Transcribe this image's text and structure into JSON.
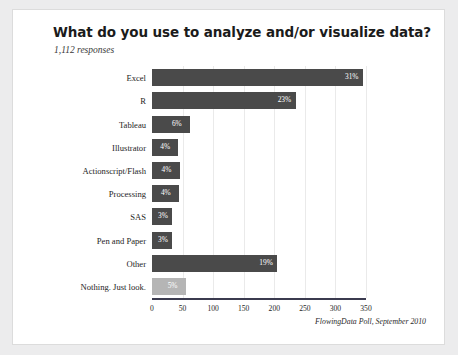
{
  "card": {
    "title": "What do you use to analyze and/or visualize data?",
    "subtitle": "1,112 responses",
    "credit": "FlowingData Poll, September 2010"
  },
  "colors": {
    "bar": "#4a4a4a",
    "bar_highlight": "#b5b5b5",
    "axis": "#3b3b4f",
    "grid": "#eaeaea",
    "card_background": "#ffffff",
    "page_background": "#ececed"
  },
  "chart_data": {
    "type": "bar",
    "orientation": "horizontal",
    "title": "What do you use to analyze and/or visualize data?",
    "subtitle": "1,112 responses",
    "xlabel": "",
    "ylabel": "",
    "xlim": [
      0,
      350
    ],
    "xticks": [
      0,
      50,
      100,
      150,
      200,
      250,
      300,
      350
    ],
    "grid": true,
    "legend": false,
    "annotation": "FlowingData Poll, September 2010",
    "categories": [
      "Excel",
      "R",
      "Tableau",
      "Illustrator",
      "Actionscript/Flash",
      "Processing",
      "SAS",
      "Pen and Paper",
      "Other",
      "Nothing. Just look."
    ],
    "values": [
      345,
      235,
      62,
      43,
      45,
      44,
      33,
      32,
      205,
      55
    ],
    "value_labels": [
      "31%",
      "23%",
      "6%",
      "4%",
      "4%",
      "4%",
      "3%",
      "3%",
      "19%",
      "5%"
    ],
    "bar_colors": [
      "#4a4a4a",
      "#4a4a4a",
      "#4a4a4a",
      "#4a4a4a",
      "#4a4a4a",
      "#4a4a4a",
      "#4a4a4a",
      "#4a4a4a",
      "#4a4a4a",
      "#b5b5b5"
    ]
  }
}
